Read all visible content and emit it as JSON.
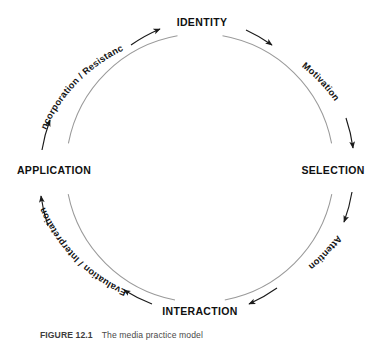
{
  "figure": {
    "caption_id": "FIGURE 12.1",
    "caption_text": "The media practice model",
    "title": "The media practice model"
  },
  "colors": {
    "inner_arc": "#9a9a9a",
    "flow_arrow": "#1a1a1a",
    "node_text": "#101010",
    "arc_text": "#141414",
    "background": "#ffffff",
    "caption_text": "#4a4a4a"
  },
  "diagram": {
    "type": "cycle",
    "direction": "clockwise",
    "center": {
      "x": 200,
      "y": 168
    },
    "inner_radius": 135,
    "outer_radius": 160,
    "nodes": [
      {
        "id": "identity",
        "label": "IDENTITY",
        "position": "top",
        "angle_deg": -90,
        "x": 202,
        "y": 22
      },
      {
        "id": "selection",
        "label": "SELECTION",
        "position": "right",
        "angle_deg": 0,
        "x": 333,
        "y": 170
      },
      {
        "id": "interaction",
        "label": "INTERACTION",
        "position": "bottom",
        "angle_deg": 90,
        "x": 200,
        "y": 311
      },
      {
        "id": "application",
        "label": "APPLICATION",
        "position": "left",
        "angle_deg": 180,
        "x": 54,
        "y": 170
      }
    ],
    "transitions": [
      {
        "id": "motivation",
        "label": "Motivation",
        "from": "identity",
        "to": "selection",
        "position": "upper-right"
      },
      {
        "id": "attention",
        "label": "Attention",
        "from": "selection",
        "to": "interaction",
        "position": "lower-right"
      },
      {
        "id": "evaluation-interpretation",
        "label": "Evaluation / Interpretation",
        "from": "interaction",
        "to": "application",
        "position": "lower-left"
      },
      {
        "id": "incorporation-resistance",
        "label": "Incorporation / Resistance",
        "from": "application",
        "to": "identity",
        "position": "upper-left"
      }
    ]
  }
}
